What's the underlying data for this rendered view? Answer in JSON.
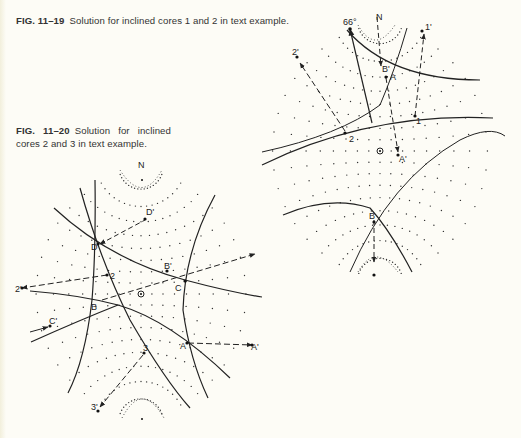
{
  "figures": [
    {
      "id": "fig-11-19",
      "number": "FIG. 11–19",
      "caption": "Solution for inclined cores 1 and 2 in text example.",
      "labels": {
        "north": "N",
        "angle": "66°",
        "pole_1": "1",
        "pole_1_rot": "1'",
        "pole_2": "2",
        "pole_2_rot": "2'",
        "point_A": "A",
        "point_A_rot": "A'",
        "point_B": "B",
        "point_B_rot": "B'"
      }
    },
    {
      "id": "fig-11-20",
      "number": "FIG. 11–20",
      "caption": "Solution for inclined cores 2 and 3 in text example.",
      "labels": {
        "north": "N",
        "pole_2": "2",
        "pole_2_rot": "2'",
        "pole_3": "3",
        "pole_3_rot": "3'",
        "point_A": "A",
        "point_A_rot": "A'",
        "point_B": "B",
        "point_B_rot": "B'",
        "point_C": "C",
        "point_C_rot": "C'",
        "point_D": "D",
        "point_D_rot": "D'"
      }
    }
  ],
  "colors": {
    "paper": "#fdfcf6",
    "ink": "#2a2a2a"
  }
}
